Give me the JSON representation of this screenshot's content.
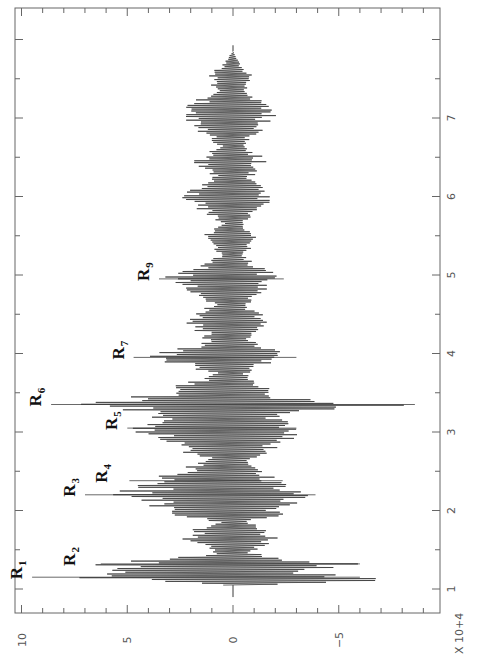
{
  "chart_data": {
    "type": "line",
    "orientation": "rotated-90-ccw",
    "title": "",
    "xlabel": "",
    "x_multiplier_label": "X 10+4",
    "ylabel": "",
    "xlim": [
      0.7,
      8.4
    ],
    "ylim": [
      -9.4,
      10.3
    ],
    "x_ticks": [
      1,
      2,
      3,
      4,
      5,
      6,
      7
    ],
    "x_tick_labels": [
      "1",
      "2",
      "3",
      "4",
      "5",
      "6",
      "7"
    ],
    "y_ticks": [
      10,
      5,
      0,
      -5
    ],
    "y_tick_labels": [
      "10",
      "5",
      "0",
      "-5"
    ],
    "grid": false,
    "legend": null,
    "signal": {
      "x_start": 1.05,
      "x_end": 7.85,
      "color": "#3a3a3a",
      "envelope_top": [
        [
          1.05,
          0.6
        ],
        [
          1.1,
          4.5
        ],
        [
          1.15,
          9.5
        ],
        [
          1.2,
          6.5
        ],
        [
          1.3,
          7.0
        ],
        [
          1.38,
          4.0
        ],
        [
          1.45,
          1.0
        ],
        [
          1.55,
          1.8
        ],
        [
          1.65,
          2.8
        ],
        [
          1.75,
          2.0
        ],
        [
          1.85,
          0.8
        ],
        [
          1.95,
          3.0
        ],
        [
          2.05,
          4.5
        ],
        [
          2.15,
          5.5
        ],
        [
          2.2,
          7.0
        ],
        [
          2.27,
          5.0
        ],
        [
          2.35,
          5.5
        ],
        [
          2.45,
          3.5
        ],
        [
          2.55,
          2.5
        ],
        [
          2.65,
          1.5
        ],
        [
          2.75,
          2.8
        ],
        [
          2.85,
          4.0
        ],
        [
          2.95,
          4.6
        ],
        [
          3.05,
          5.0
        ],
        [
          3.15,
          3.8
        ],
        [
          3.25,
          4.0
        ],
        [
          3.35,
          8.6
        ],
        [
          3.45,
          4.8
        ],
        [
          3.55,
          3.5
        ],
        [
          3.65,
          2.0
        ],
        [
          3.75,
          1.2
        ],
        [
          3.85,
          2.5
        ],
        [
          3.95,
          4.7
        ],
        [
          4.05,
          3.0
        ],
        [
          4.15,
          1.5
        ],
        [
          4.25,
          1.5
        ],
        [
          4.35,
          2.3
        ],
        [
          4.45,
          2.5
        ],
        [
          4.55,
          1.5
        ],
        [
          4.65,
          1.2
        ],
        [
          4.75,
          2.2
        ],
        [
          4.85,
          3.0
        ],
        [
          4.95,
          3.5
        ],
        [
          5.05,
          2.5
        ],
        [
          5.15,
          1.5
        ],
        [
          5.25,
          0.8
        ],
        [
          5.35,
          1.2
        ],
        [
          5.45,
          1.8
        ],
        [
          5.55,
          1.2
        ],
        [
          5.65,
          0.6
        ],
        [
          5.75,
          1.2
        ],
        [
          5.85,
          2.0
        ],
        [
          5.95,
          2.5
        ],
        [
          6.05,
          2.3
        ],
        [
          6.15,
          1.8
        ],
        [
          6.25,
          1.2
        ],
        [
          6.35,
          1.5
        ],
        [
          6.45,
          2.2
        ],
        [
          6.55,
          1.5
        ],
        [
          6.65,
          0.8
        ],
        [
          6.75,
          1.2
        ],
        [
          6.85,
          1.8
        ],
        [
          6.95,
          2.2
        ],
        [
          7.05,
          2.5
        ],
        [
          7.15,
          2.4
        ],
        [
          7.25,
          1.6
        ],
        [
          7.35,
          1.0
        ],
        [
          7.45,
          1.3
        ],
        [
          7.55,
          1.2
        ],
        [
          7.65,
          0.7
        ],
        [
          7.75,
          0.3
        ],
        [
          7.85,
          0.0
        ]
      ],
      "envelope_bottom": [
        [
          1.05,
          0.6
        ],
        [
          1.1,
          9.2
        ],
        [
          1.15,
          6.0
        ],
        [
          1.22,
          4.5
        ],
        [
          1.3,
          7.0
        ],
        [
          1.38,
          3.0
        ],
        [
          1.45,
          1.0
        ],
        [
          1.55,
          1.5
        ],
        [
          1.65,
          2.5
        ],
        [
          1.75,
          1.8
        ],
        [
          1.85,
          0.8
        ],
        [
          1.95,
          2.5
        ],
        [
          2.05,
          3.0
        ],
        [
          2.15,
          3.2
        ],
        [
          2.2,
          3.9
        ],
        [
          2.27,
          3.2
        ],
        [
          2.35,
          2.5
        ],
        [
          2.45,
          2.0
        ],
        [
          2.55,
          1.5
        ],
        [
          2.65,
          1.0
        ],
        [
          2.75,
          1.8
        ],
        [
          2.85,
          2.6
        ],
        [
          2.95,
          3.2
        ],
        [
          3.05,
          3.0
        ],
        [
          3.15,
          2.5
        ],
        [
          3.25,
          3.0
        ],
        [
          3.35,
          8.6
        ],
        [
          3.45,
          2.2
        ],
        [
          3.55,
          1.8
        ],
        [
          3.65,
          1.2
        ],
        [
          3.75,
          0.8
        ],
        [
          3.85,
          1.6
        ],
        [
          3.95,
          3.0
        ],
        [
          4.05,
          2.0
        ],
        [
          4.15,
          1.0
        ],
        [
          4.25,
          1.0
        ],
        [
          4.35,
          1.8
        ],
        [
          4.45,
          1.8
        ],
        [
          4.55,
          1.0
        ],
        [
          4.65,
          0.8
        ],
        [
          4.75,
          1.6
        ],
        [
          4.85,
          2.0
        ],
        [
          4.95,
          2.4
        ],
        [
          5.05,
          1.8
        ],
        [
          5.15,
          1.0
        ],
        [
          5.25,
          0.6
        ],
        [
          5.35,
          0.9
        ],
        [
          5.45,
          1.3
        ],
        [
          5.55,
          0.9
        ],
        [
          5.65,
          0.5
        ],
        [
          5.75,
          1.0
        ],
        [
          5.85,
          1.6
        ],
        [
          5.95,
          2.0
        ],
        [
          6.05,
          1.8
        ],
        [
          6.15,
          1.4
        ],
        [
          6.25,
          1.0
        ],
        [
          6.35,
          1.2
        ],
        [
          6.45,
          1.7
        ],
        [
          6.55,
          1.2
        ],
        [
          6.65,
          0.6
        ],
        [
          6.75,
          1.0
        ],
        [
          6.85,
          1.5
        ],
        [
          6.95,
          1.8
        ],
        [
          7.05,
          2.1
        ],
        [
          7.15,
          1.9
        ],
        [
          7.25,
          1.3
        ],
        [
          7.35,
          0.8
        ],
        [
          7.45,
          1.0
        ],
        [
          7.55,
          0.9
        ],
        [
          7.65,
          0.5
        ],
        [
          7.75,
          0.2
        ],
        [
          7.85,
          0.0
        ]
      ],
      "oscillation_period": 0.0235
    },
    "annotations": [
      {
        "label": "R",
        "sub": "1",
        "x": 1.15,
        "y": 9.5
      },
      {
        "label": "R",
        "sub": "2",
        "x": 1.32,
        "y": 7.0
      },
      {
        "label": "R",
        "sub": "3",
        "x": 2.2,
        "y": 7.0
      },
      {
        "label": "R",
        "sub": "4",
        "x": 2.38,
        "y": 5.5
      },
      {
        "label": "R",
        "sub": "5",
        "x": 3.05,
        "y": 5.0
      },
      {
        "label": "R",
        "sub": "6",
        "x": 3.35,
        "y": 8.6
      },
      {
        "label": "R",
        "sub": "7",
        "x": 3.95,
        "y": 4.7
      },
      {
        "label": "R",
        "sub": "9",
        "x": 4.95,
        "y": 3.5
      }
    ]
  },
  "axis_labels": {
    "x_multiplier": "X 10+4"
  }
}
